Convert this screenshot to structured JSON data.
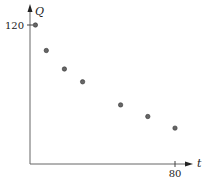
{
  "chart_data": {
    "type": "scatter",
    "title": "",
    "xlabel": "t",
    "ylabel": "Q",
    "x": [
      3,
      9,
      19,
      29,
      50,
      65,
      80
    ],
    "values": [
      120,
      98,
      82,
      71,
      51,
      41,
      31
    ],
    "xticks": [
      80
    ],
    "yticks": [
      120
    ],
    "xlim": [
      0,
      90
    ],
    "ylim": [
      0,
      125
    ],
    "grid": false,
    "legend": "none"
  },
  "labels": {
    "x_axis": "t",
    "y_axis": "Q",
    "x_tick": "80",
    "y_tick": "120"
  },
  "colors": {
    "axis": "#555555",
    "point_fill": "#666666",
    "point_stroke": "#333333"
  }
}
